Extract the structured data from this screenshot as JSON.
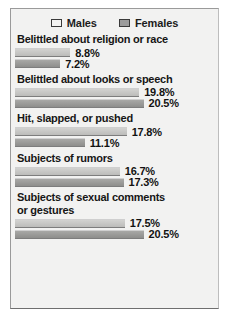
{
  "legend": {
    "entries": [
      {
        "label": "Males",
        "swatch": "males-swatch"
      },
      {
        "label": "Females",
        "swatch": "females-swatch"
      }
    ]
  },
  "colors": {
    "males_bar": "#c7c7c5",
    "females_bar": "#9b9b99",
    "background": "#f2f2f1",
    "frame_border": "#9a9a9a",
    "text": "#161616"
  },
  "chart_data": {
    "type": "bar",
    "orientation": "horizontal",
    "title": "",
    "xlabel": "",
    "ylabel": "",
    "grid": false,
    "legend_position": "top",
    "value_suffix": "%",
    "xlim": [
      0,
      22
    ],
    "categories": [
      "Belittled about religion or race",
      "Belittled about looks or speech",
      "Hit, slapped, or pushed",
      "Subjects of rumors",
      "Subjects of sexual comments\nor gestures"
    ],
    "series": [
      {
        "name": "Males",
        "values": [
          8.8,
          19.8,
          17.8,
          16.7,
          17.5
        ]
      },
      {
        "name": "Females",
        "values": [
          7.2,
          20.5,
          11.1,
          17.3,
          20.5
        ]
      }
    ],
    "groups": [
      {
        "label": "Belittled about religion or race",
        "bars": [
          {
            "series": "Males",
            "value": 8.8,
            "label": "8.8%"
          },
          {
            "series": "Females",
            "value": 7.2,
            "label": "7.2%"
          }
        ]
      },
      {
        "label": "Belittled about looks or speech",
        "bars": [
          {
            "series": "Males",
            "value": 19.8,
            "label": "19.8%"
          },
          {
            "series": "Females",
            "value": 20.5,
            "label": "20.5%"
          }
        ]
      },
      {
        "label": "Hit, slapped, or pushed",
        "bars": [
          {
            "series": "Males",
            "value": 17.8,
            "label": "17.8%"
          },
          {
            "series": "Females",
            "value": 11.1,
            "label": "11.1%"
          }
        ]
      },
      {
        "label": "Subjects of rumors",
        "bars": [
          {
            "series": "Males",
            "value": 16.7,
            "label": "16.7%"
          },
          {
            "series": "Females",
            "value": 17.3,
            "label": "17.3%"
          }
        ]
      },
      {
        "label": "Subjects of sexual comments\nor gestures",
        "bars": [
          {
            "series": "Males",
            "value": 17.5,
            "label": "17.5%"
          },
          {
            "series": "Females",
            "value": 20.5,
            "label": "20.5%"
          }
        ]
      }
    ]
  }
}
